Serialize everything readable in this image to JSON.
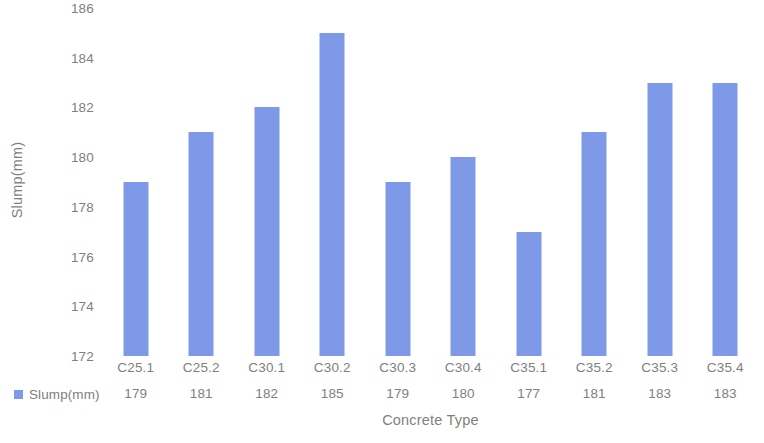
{
  "chart_data": {
    "type": "bar",
    "title": "",
    "subtitle": "",
    "xlabel": "Concrete Type",
    "ylabel": "Slump(mm)",
    "categories": [
      "C25.1",
      "C25.2",
      "C30.1",
      "C30.2",
      "C30.3",
      "C30.4",
      "C35.1",
      "C35.2",
      "C35.3",
      "C35.4"
    ],
    "values": [
      179,
      181,
      182,
      185,
      179,
      180,
      177,
      181,
      183,
      183
    ],
    "series": [
      {
        "name": "Slump(mm)",
        "values": [
          179,
          181,
          182,
          185,
          179,
          180,
          177,
          181,
          183,
          183
        ],
        "color": "#7d99e8"
      }
    ],
    "ylim": [
      172,
      186
    ],
    "ytick_values": [
      186,
      184,
      182,
      180,
      178,
      176,
      174,
      172
    ],
    "ytick_labels": [
      "186",
      "184",
      "182",
      "180",
      "178",
      "176",
      "174",
      "172"
    ],
    "ytick_step": 2,
    "grid": false,
    "legend": {
      "entries": [
        {
          "label": "Slump(mm)",
          "color": "#7d99e8",
          "marker": "square"
        }
      ],
      "position": "bottom-left-table"
    },
    "data_table": {
      "visible": true,
      "row_header": "Slump(mm)",
      "column_headers": [
        "C25.1",
        "C25.2",
        "C30.1",
        "C30.2",
        "C30.3",
        "C30.4",
        "C35.1",
        "C35.2",
        "C35.3",
        "C35.4"
      ],
      "row_values": [
        "179",
        "181",
        "182",
        "185",
        "179",
        "180",
        "177",
        "181",
        "183",
        "183"
      ]
    },
    "colors": {
      "bar": "#7d99e8",
      "text": "#808080",
      "axis_title": "#7f7f7f",
      "background": "#ffffff",
      "axis_line": "#e3e3e3"
    }
  }
}
